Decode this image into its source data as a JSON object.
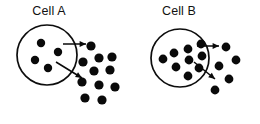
{
  "figure": {
    "width": 260,
    "height": 124,
    "background_color": "#ffffff",
    "ink_color": "#0a0a0a"
  },
  "panels": [
    {
      "id": "panel-a",
      "label": "Cell A",
      "label_position": {
        "x": 49,
        "y": 15
      },
      "cell": {
        "name": "cell-a-membrane",
        "shape": "circle",
        "cx": 47,
        "cy": 55,
        "r": 30,
        "stroke": "#0d0d0d",
        "stroke_width": 1.7
      },
      "internal_molecules": [
        {
          "cx": 41,
          "cy": 43,
          "r": 4.2
        },
        {
          "cx": 58,
          "cy": 52,
          "r": 4.2
        },
        {
          "cx": 35,
          "cy": 60,
          "r": 4.2
        },
        {
          "cx": 48,
          "cy": 68,
          "r": 4.2
        }
      ],
      "external_molecules": [
        {
          "cx": 91,
          "cy": 46,
          "r": 4.6
        },
        {
          "cx": 83,
          "cy": 62,
          "r": 4.6
        },
        {
          "cx": 99,
          "cy": 58,
          "r": 4.6
        },
        {
          "cx": 112,
          "cy": 57,
          "r": 4.6
        },
        {
          "cx": 94,
          "cy": 71,
          "r": 4.6
        },
        {
          "cx": 110,
          "cy": 70,
          "r": 4.6
        },
        {
          "cx": 82,
          "cy": 82,
          "r": 4.6
        },
        {
          "cx": 99,
          "cy": 85,
          "r": 4.6
        },
        {
          "cx": 85,
          "cy": 98,
          "r": 4.6
        },
        {
          "cx": 102,
          "cy": 100,
          "r": 4.6
        },
        {
          "cx": 115,
          "cy": 87,
          "r": 4.6
        }
      ],
      "arrows": [
        {
          "name": "secretion-arrow-horizontal",
          "x1": 63,
          "y1": 44,
          "x2": 86,
          "y2": 44,
          "direction": "right"
        },
        {
          "name": "secretion-arrow-diagonal",
          "x1": 56,
          "y1": 62,
          "x2": 82,
          "y2": 78,
          "direction": "down-right"
        }
      ]
    },
    {
      "id": "panel-b",
      "label": "Cell B",
      "label_position": {
        "x": 179,
        "y": 15
      },
      "cell": {
        "name": "cell-b-membrane",
        "shape": "circle",
        "cx": 180,
        "cy": 58,
        "r": 29,
        "stroke": "#0d0d0d",
        "stroke_width": 1.7
      },
      "internal_molecules": [
        {
          "cx": 201,
          "cy": 44,
          "r": 4.4
        },
        {
          "cx": 188,
          "cy": 49,
          "r": 4.4
        },
        {
          "cx": 202,
          "cy": 56,
          "r": 4.4
        },
        {
          "cx": 174,
          "cy": 53,
          "r": 4.4
        },
        {
          "cx": 189,
          "cy": 60,
          "r": 4.4
        },
        {
          "cx": 163,
          "cy": 59,
          "r": 4.4
        },
        {
          "cx": 176,
          "cy": 67,
          "r": 4.4
        },
        {
          "cx": 199,
          "cy": 68,
          "r": 4.4
        },
        {
          "cx": 188,
          "cy": 76,
          "r": 4.4
        }
      ],
      "external_molecules": [
        {
          "cx": 226,
          "cy": 47,
          "r": 4.4
        },
        {
          "cx": 236,
          "cy": 60,
          "r": 4.4
        },
        {
          "cx": 219,
          "cy": 66,
          "r": 4.4
        },
        {
          "cx": 229,
          "cy": 79,
          "r": 4.4
        },
        {
          "cx": 215,
          "cy": 90,
          "r": 4.4
        }
      ],
      "arrows": [
        {
          "name": "secretion-arrow-horizontal",
          "x1": 197,
          "y1": 46,
          "x2": 219,
          "y2": 46,
          "direction": "right"
        },
        {
          "name": "secretion-arrow-diagonal",
          "x1": 194,
          "y1": 62,
          "x2": 215,
          "y2": 79,
          "direction": "down-right"
        }
      ]
    }
  ]
}
